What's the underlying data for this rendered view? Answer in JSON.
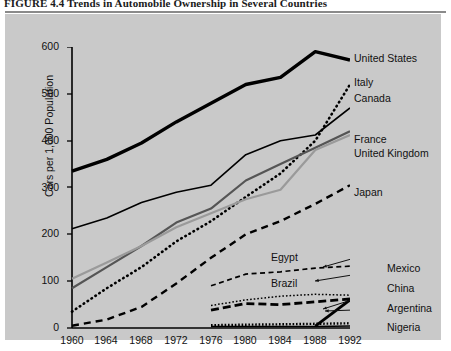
{
  "figure": {
    "title": "FIGURE 4.4    Trends in Automobile Ownership in Several Countries"
  },
  "colors": {
    "panel_background": "#c9c9c9",
    "axis": "#000000",
    "dark_gray": "#555555",
    "light_gray": "#9a9a9a",
    "black": "#000000",
    "title_rule": "#8a8a8a"
  },
  "axes": {
    "y_title": "Cars per 1,000 Population",
    "x_title": "Year",
    "y_ticks": [
      "0",
      "100",
      "200",
      "300",
      "400",
      "500",
      "600"
    ],
    "x_ticks": [
      "1960",
      "1964",
      "1968",
      "1972",
      "1976",
      "1980",
      "1984",
      "1988",
      "1992"
    ]
  },
  "labels": {
    "united_states": "United States",
    "italy": "Italy",
    "canada": "Canada",
    "france": "France",
    "united_kingdom": "United Kingdom",
    "japan": "Japan",
    "egypt": "Egypt",
    "brazil": "Brazil",
    "mexico": "Mexico",
    "china": "China",
    "argentina": "Argentina",
    "nigeria": "Nigeria"
  },
  "chart_data": {
    "type": "line",
    "title": "Trends in Automobile Ownership in Several Countries",
    "xlabel": "Year",
    "ylabel": "Cars per 1,000 Population",
    "xlim": [
      1960,
      1992
    ],
    "ylim": [
      0,
      600
    ],
    "grid": false,
    "legend": "inline-right-labels",
    "x": [
      1960,
      1964,
      1968,
      1972,
      1976,
      1980,
      1984,
      1988,
      1992
    ],
    "series": [
      {
        "name": "United States",
        "style": "solid-thick-black",
        "values": [
          335,
          360,
          395,
          440,
          480,
          520,
          535,
          590,
          572
        ]
      },
      {
        "name": "Canada",
        "style": "solid-thin-black",
        "values": [
          212,
          235,
          268,
          290,
          305,
          370,
          400,
          412,
          470
        ]
      },
      {
        "name": "Italy",
        "style": "dotted-black",
        "values": [
          35,
          85,
          130,
          185,
          228,
          280,
          330,
          400,
          520
        ]
      },
      {
        "name": "France",
        "style": "solid-dark-gray",
        "values": [
          85,
          130,
          175,
          225,
          255,
          315,
          350,
          385,
          420
        ]
      },
      {
        "name": "United Kingdom",
        "style": "solid-light-gray",
        "values": [
          105,
          140,
          175,
          215,
          245,
          275,
          295,
          380,
          412
        ]
      },
      {
        "name": "Japan",
        "style": "dashed-coarse-black",
        "values": [
          5,
          18,
          45,
          95,
          150,
          200,
          228,
          265,
          305
        ]
      },
      {
        "name": "Egypt",
        "style": "dashed-fine-black",
        "values": [
          null,
          null,
          null,
          null,
          90,
          115,
          120,
          128,
          132
        ]
      },
      {
        "name": "Brazil",
        "style": "dotted-fine-black",
        "values": [
          null,
          null,
          null,
          null,
          48,
          60,
          68,
          72,
          70
        ]
      },
      {
        "name": "Mexico",
        "style": "dashed-heavy-black",
        "values": [
          null,
          null,
          null,
          null,
          38,
          52,
          50,
          56,
          62
        ]
      },
      {
        "name": "China",
        "style": "dotted-dense-black",
        "values": [
          null,
          null,
          null,
          null,
          6,
          7,
          8,
          9,
          10
        ]
      },
      {
        "name": "Argentina",
        "style": "solid-thick-black-short",
        "values": [
          null,
          null,
          null,
          null,
          null,
          null,
          null,
          4,
          60
        ]
      },
      {
        "name": "Nigeria",
        "style": "solid-thin-black-flat",
        "values": [
          null,
          null,
          null,
          null,
          3,
          3,
          3,
          3,
          4
        ]
      }
    ]
  }
}
